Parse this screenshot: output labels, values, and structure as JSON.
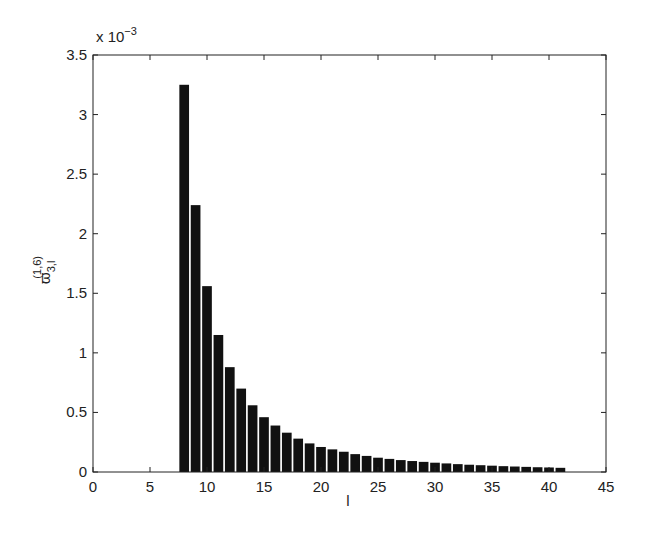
{
  "chart_data": {
    "type": "bar",
    "title": "",
    "xlabel": "l",
    "ylabel": "ϖ_{3,l}^{(1,6)}",
    "ylabel_main": "ϖ",
    "ylabel_sub": "3,l",
    "ylabel_sup": "(1,6)",
    "y_multiplier": "x 10",
    "y_multiplier_exp": "−3",
    "xlim": [
      0,
      45
    ],
    "ylim": [
      0,
      3.5
    ],
    "xticks": [
      "0",
      "5",
      "10",
      "15",
      "20",
      "25",
      "30",
      "35",
      "40",
      "45"
    ],
    "yticks": [
      "0",
      "0.5",
      "1",
      "1.5",
      "2",
      "2.5",
      "3",
      "3.5"
    ],
    "grid": false,
    "bar_color": "#111111",
    "x": [
      8,
      9,
      10,
      11,
      12,
      13,
      14,
      15,
      16,
      17,
      18,
      19,
      20,
      21,
      22,
      23,
      24,
      25,
      26,
      27,
      28,
      29,
      30,
      31,
      32,
      33,
      34,
      35,
      36,
      37,
      38,
      39,
      40,
      41
    ],
    "values": [
      3.25,
      2.24,
      1.56,
      1.15,
      0.88,
      0.7,
      0.56,
      0.46,
      0.39,
      0.33,
      0.28,
      0.24,
      0.21,
      0.19,
      0.17,
      0.15,
      0.135,
      0.12,
      0.11,
      0.1,
      0.092,
      0.085,
      0.078,
      0.072,
      0.066,
      0.061,
      0.057,
      0.053,
      0.049,
      0.046,
      0.043,
      0.04,
      0.038,
      0.035
    ]
  }
}
